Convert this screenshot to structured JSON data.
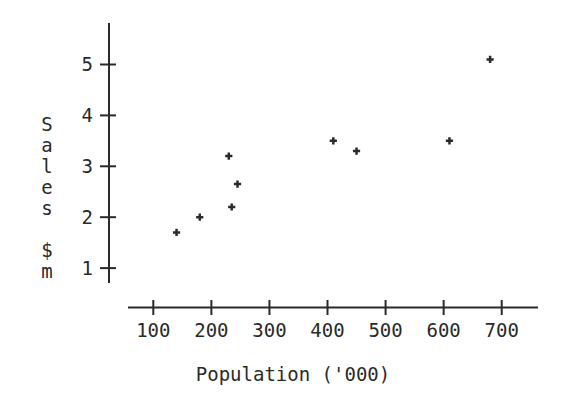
{
  "figure": {
    "background": "#ffffff",
    "ink_color": "#2a2a2a"
  },
  "chart_data": {
    "type": "scatter",
    "title": "",
    "xlabel": "Population ('000)",
    "ylabel": "Sales $m",
    "x_ticks": [
      100,
      200,
      300,
      400,
      500,
      600,
      700
    ],
    "y_ticks": [
      1,
      2,
      3,
      4,
      5
    ],
    "xlim": [
      55,
      765
    ],
    "ylim": [
      0.7,
      5.8
    ],
    "grid": false,
    "legend": "none",
    "marker": "plus",
    "points": [
      [
        140,
        1.7
      ],
      [
        180,
        2.0
      ],
      [
        230,
        3.2
      ],
      [
        235,
        2.2
      ],
      [
        245,
        2.65
      ],
      [
        410,
        3.5
      ],
      [
        450,
        3.3
      ],
      [
        610,
        3.5
      ],
      [
        680,
        5.1
      ]
    ]
  }
}
